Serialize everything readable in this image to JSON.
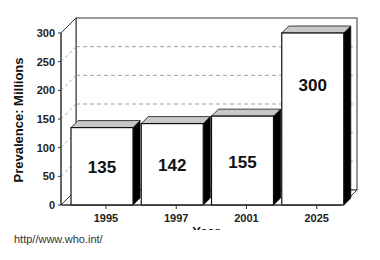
{
  "chart_data": {
    "type": "bar",
    "style": "3d",
    "title": "",
    "xlabel": "Year",
    "ylabel": "Prevalence: Millions",
    "categories": [
      "1995",
      "1997",
      "2001",
      "2025"
    ],
    "values": [
      135,
      142,
      155,
      300
    ],
    "data_labels": [
      "135",
      "142",
      "155",
      "300"
    ],
    "ylim": [
      0,
      300
    ],
    "yticks": [
      0,
      50,
      100,
      150,
      200,
      250,
      300
    ],
    "ytick_labels": [
      "0",
      "50",
      "100",
      "150",
      "200",
      "250",
      "300"
    ],
    "grid": "dashed horizontal on back wall",
    "legend": null,
    "colors": {
      "bar_front": "#ffffff",
      "bar_top": "#c8c8c8",
      "bar_side": "#000000",
      "grid": "#888888",
      "axis": "#333333"
    }
  },
  "source": "http//www.who.int/"
}
